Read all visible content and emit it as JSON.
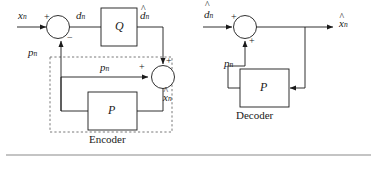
{
  "figure": {
    "background_color": "#ffffff",
    "line_color": "#1a1a1a",
    "box_fill": "#ffffff"
  },
  "encoder": {
    "caption": "Encoder",
    "input_label": "x",
    "input_sub": "n",
    "diff_label": "d",
    "diff_sub": "n",
    "quantizer_label": "Q",
    "quantized_label": "d",
    "quantized_sub": "n",
    "quantized_hat": "^",
    "predictor_label": "P",
    "prediction_label": "p",
    "prediction_sub": "n",
    "prediction_label_inner": "p",
    "prediction_sub_inner": "n",
    "recon_label": "x",
    "recon_sub": "n",
    "recon_hat": "^",
    "sum1_plus": "+",
    "sum1_minus": "−",
    "sum2_plus_top": "+",
    "sum2_plus_left": "+"
  },
  "decoder": {
    "caption": "Decoder",
    "input_label": "d",
    "input_sub": "n",
    "input_hat": "^",
    "predictor_label": "P",
    "prediction_label": "p",
    "prediction_sub": "n",
    "output_label": "x",
    "output_sub": "n",
    "output_hat": "^",
    "sum_plus_left": "+",
    "sum_plus_bottom": "+"
  }
}
